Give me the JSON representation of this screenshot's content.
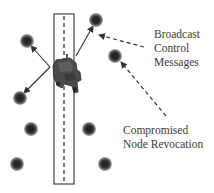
{
  "diagram": {
    "type": "vehicular-network-illustration",
    "labels": {
      "broadcast": [
        "Broadcast",
        "Control",
        "Messages"
      ],
      "revocation": [
        "Compromised",
        "Node Revocation"
      ]
    },
    "road": {
      "x": 54,
      "y": 14,
      "width": 20,
      "height": 170,
      "centerline_x": 64
    },
    "vehicle": {
      "x": 52,
      "y": 57,
      "width": 30,
      "height": 36,
      "icon": "truck-icon"
    },
    "nodes": [
      {
        "id": "n1",
        "cx": 96,
        "cy": 20
      },
      {
        "id": "n2",
        "cx": 27,
        "cy": 41
      },
      {
        "id": "n3",
        "cx": 115,
        "cy": 56
      },
      {
        "id": "n4",
        "cx": 20,
        "cy": 98
      },
      {
        "id": "n5",
        "cx": 31,
        "cy": 129
      },
      {
        "id": "n6",
        "cx": 89,
        "cy": 129
      },
      {
        "id": "n7",
        "cx": 17,
        "cy": 164
      },
      {
        "id": "n8",
        "cx": 105,
        "cy": 164
      }
    ],
    "solid_arrows": [
      {
        "from": [
          50,
          67
        ],
        "to": [
          31,
          46
        ],
        "target": "n2"
      },
      {
        "from": [
          50,
          67
        ],
        "to": [
          24,
          93
        ],
        "target": "n4"
      },
      {
        "from": [
          76,
          56
        ],
        "to": [
          93,
          26
        ],
        "target": "n1"
      }
    ],
    "dashed_arrows": [
      {
        "from": [
          144,
          47
        ],
        "to": [
          99,
          35
        ],
        "label": "broadcast"
      },
      {
        "from": [
          166,
          116
        ],
        "to": [
          121,
          62
        ],
        "label": "revocation"
      }
    ],
    "colors": {
      "node_core": "#2b2b2b",
      "node_halo": "#8a8a8a",
      "line": "#333333",
      "vehicle": "#4a4a4a"
    }
  }
}
